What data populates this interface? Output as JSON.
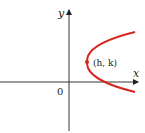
{
  "diagram": {
    "type": "parabola-graph",
    "axes": {
      "x_label": "x",
      "y_label": "y",
      "origin_label": "0"
    },
    "curve": {
      "description": "parabola opening to the right",
      "color": "#d7261e"
    },
    "vertex": {
      "label": "(h, k)",
      "color": "#d7261e"
    },
    "axis_color": "#231f20"
  }
}
